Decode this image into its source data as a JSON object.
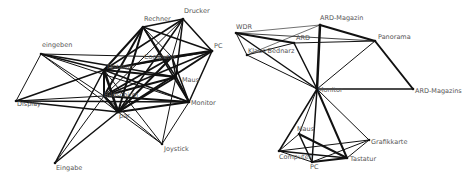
{
  "graphs": [
    {
      "id": "left",
      "name": "computer-terms-network",
      "nodes": [
        {
          "id": "Rechner",
          "label": "Rechner",
          "x": 143,
          "y": 27,
          "lx": 1,
          "ly": -6
        },
        {
          "id": "Drucker",
          "label": "Drucker",
          "x": 183,
          "y": 19,
          "lx": 1,
          "ly": -6
        },
        {
          "id": "PC",
          "label": "PC",
          "x": 212,
          "y": 51,
          "lx": 2,
          "ly": -3
        },
        {
          "id": "eingeben",
          "label": "eingeben",
          "x": 41,
          "y": 54,
          "lx": 1,
          "ly": -7
        },
        {
          "id": "Computer",
          "label": "Computer",
          "x": 172,
          "y": 57,
          "lx": -28,
          "ly": 2
        },
        {
          "id": "Tastatur",
          "label": "Tastatur",
          "x": 104,
          "y": 70,
          "lx": 2,
          "ly": -1
        },
        {
          "id": "Maus",
          "label": "Maus",
          "x": 176,
          "y": 77,
          "lx": 6,
          "ly": 5
        },
        {
          "id": "Bildschirm",
          "label": "Bildschirm",
          "x": 104,
          "y": 96,
          "lx": 0,
          "ly": 1
        },
        {
          "id": "Monitor",
          "label": "Monitor",
          "x": 189,
          "y": 102,
          "lx": 2,
          "ly": 3
        },
        {
          "id": "Display",
          "label": "Display",
          "x": 16,
          "y": 101,
          "lx": 1,
          "ly": 5
        },
        {
          "id": "par",
          "label": "par",
          "x": 118,
          "y": 112,
          "lx": 1,
          "ly": 6
        },
        {
          "id": "Joystick",
          "label": "Joystick",
          "x": 162,
          "y": 144,
          "lx": 2,
          "ly": 7
        },
        {
          "id": "Eingabe",
          "label": "Eingabe",
          "x": 55,
          "y": 163,
          "lx": 1,
          "ly": 7
        }
      ],
      "edges": [
        [
          "Rechner",
          "Drucker",
          1.5
        ],
        [
          "Rechner",
          "PC",
          1.5
        ],
        [
          "Rechner",
          "Tastatur",
          2
        ],
        [
          "Rechner",
          "Bildschirm",
          2
        ],
        [
          "Rechner",
          "Computer",
          1
        ],
        [
          "Rechner",
          "Maus",
          1.5
        ],
        [
          "Rechner",
          "Monitor",
          1.5
        ],
        [
          "Rechner",
          "par",
          2
        ],
        [
          "Drucker",
          "PC",
          1.5
        ],
        [
          "Drucker",
          "Computer",
          1
        ],
        [
          "Drucker",
          "Tastatur",
          1.5
        ],
        [
          "Drucker",
          "Maus",
          1.5
        ],
        [
          "Drucker",
          "Bildschirm",
          1
        ],
        [
          "Drucker",
          "par",
          1.5
        ],
        [
          "PC",
          "Computer",
          2.5
        ],
        [
          "PC",
          "Tastatur",
          1.5
        ],
        [
          "PC",
          "Monitor",
          1.5
        ],
        [
          "PC",
          "par",
          2
        ],
        [
          "PC",
          "Bildschirm",
          1.5
        ],
        [
          "eingeben",
          "Display",
          1
        ],
        [
          "eingeben",
          "Tastatur",
          1.5
        ],
        [
          "eingeben",
          "Computer",
          1
        ],
        [
          "eingeben",
          "Maus",
          1.5
        ],
        [
          "eingeben",
          "par",
          1
        ],
        [
          "eingeben",
          "Bildschirm",
          1
        ],
        [
          "eingeben",
          "Monitor",
          1
        ],
        [
          "Display",
          "Tastatur",
          1.5
        ],
        [
          "Display",
          "Bildschirm",
          1
        ],
        [
          "Display",
          "Monitor",
          1.5
        ],
        [
          "Display",
          "par",
          1.5
        ],
        [
          "Computer",
          "Tastatur",
          2
        ],
        [
          "Computer",
          "Bildschirm",
          2
        ],
        [
          "Computer",
          "Maus",
          1.5
        ],
        [
          "Computer",
          "Monitor",
          1.5
        ],
        [
          "Computer",
          "par",
          2
        ],
        [
          "Tastatur",
          "Maus",
          2
        ],
        [
          "Tastatur",
          "Bildschirm",
          2
        ],
        [
          "Tastatur",
          "Monitor",
          1.5
        ],
        [
          "Tastatur",
          "par",
          2.5
        ],
        [
          "Tastatur",
          "Joystick",
          1
        ],
        [
          "Tastatur",
          "Eingabe",
          1.5
        ],
        [
          "Maus",
          "Bildschirm",
          2
        ],
        [
          "Maus",
          "Monitor",
          2
        ],
        [
          "Maus",
          "par",
          2
        ],
        [
          "Maus",
          "Joystick",
          1
        ],
        [
          "Bildschirm",
          "Monitor",
          2
        ],
        [
          "Bildschirm",
          "par",
          2.5
        ],
        [
          "Bildschirm",
          "Joystick",
          1
        ],
        [
          "Bildschirm",
          "Eingabe",
          1
        ],
        [
          "Monitor",
          "par",
          2
        ],
        [
          "Monitor",
          "Joystick",
          1
        ],
        [
          "par",
          "Joystick",
          1
        ],
        [
          "par",
          "Eingabe",
          1.5
        ]
      ]
    },
    {
      "id": "right",
      "name": "media-and-hardware-network",
      "nodes": [
        {
          "id": "WDR",
          "label": "WDR",
          "x": 236,
          "y": 33,
          "lx": 0,
          "ly": -4
        },
        {
          "id": "ARD-Magazin",
          "label": "ARD-Magazin",
          "x": 320,
          "y": 25,
          "lx": 0,
          "ly": -5
        },
        {
          "id": "ARD",
          "label": "ARD",
          "x": 294,
          "y": 43,
          "lx": 2,
          "ly": -3
        },
        {
          "id": "Klaus Bednarz",
          "label": "Klaus Bednarz",
          "x": 247,
          "y": 55,
          "lx": 1,
          "ly": -2
        },
        {
          "id": "Panorama",
          "label": "Panorama",
          "x": 375,
          "y": 41,
          "lx": 3,
          "ly": -2
        },
        {
          "id": "ARD-Magazins",
          "label": "ARD-Magazins",
          "x": 413,
          "y": 89,
          "lx": 2,
          "ly": 4
        },
        {
          "id": "Monitor2",
          "label": "Monitor",
          "x": 317,
          "y": 89,
          "lx": 1,
          "ly": 3
        },
        {
          "id": "Maus2",
          "label": "Maus",
          "x": 299,
          "y": 134,
          "lx": -2,
          "ly": -3
        },
        {
          "id": "Grafikkarte",
          "label": "Grafikkarte",
          "x": 369,
          "y": 140,
          "lx": 2,
          "ly": 4
        },
        {
          "id": "Computer2",
          "label": "Computer",
          "x": 279,
          "y": 151,
          "lx": 0,
          "ly": 8
        },
        {
          "id": "Tastatur2",
          "label": "Tastatur",
          "x": 347,
          "y": 158,
          "lx": 3,
          "ly": 3
        },
        {
          "id": "PC2",
          "label": "PC",
          "x": 312,
          "y": 162,
          "lx": -2,
          "ly": 7
        }
      ],
      "edges": [
        [
          "WDR",
          "ARD",
          2
        ],
        [
          "WDR",
          "Klaus Bednarz",
          1
        ],
        [
          "WDR",
          "Monitor2",
          1.5
        ],
        [
          "WDR",
          "ARD-Magazin",
          0.6
        ],
        [
          "WDR",
          "Panorama",
          0.8
        ],
        [
          "Klaus Bednarz",
          "ARD",
          1
        ],
        [
          "Klaus Bednarz",
          "Monitor2",
          1
        ],
        [
          "Klaus Bednarz",
          "ARD-Magazin",
          0.6
        ],
        [
          "ARD",
          "Monitor2",
          1.5
        ],
        [
          "ARD",
          "Panorama",
          1
        ],
        [
          "ARD-Magazin",
          "Panorama",
          2
        ],
        [
          "ARD-Magazin",
          "Monitor2",
          2.5
        ],
        [
          "Panorama",
          "ARD-Magazins",
          2
        ],
        [
          "Panorama",
          "Monitor2",
          1
        ],
        [
          "ARD-Magazins",
          "Monitor2",
          1.5
        ],
        [
          "Monitor2",
          "Computer2",
          1.5
        ],
        [
          "Monitor2",
          "Maus2",
          1
        ],
        [
          "Monitor2",
          "Tastatur2",
          2
        ],
        [
          "Monitor2",
          "Grafikkarte",
          1
        ],
        [
          "Monitor2",
          "PC2",
          1.5
        ],
        [
          "Maus2",
          "PC2",
          1.5
        ],
        [
          "Maus2",
          "Tastatur2",
          2
        ],
        [
          "Maus2",
          "Computer2",
          1
        ],
        [
          "Computer2",
          "Tastatur2",
          1.5
        ],
        [
          "Computer2",
          "PC2",
          1
        ],
        [
          "Computer2",
          "Grafikkarte",
          1
        ],
        [
          "Grafikkarte",
          "PC2",
          1
        ],
        [
          "Grafikkarte",
          "Tastatur2",
          1
        ],
        [
          "Tastatur2",
          "PC2",
          2
        ]
      ]
    }
  ]
}
